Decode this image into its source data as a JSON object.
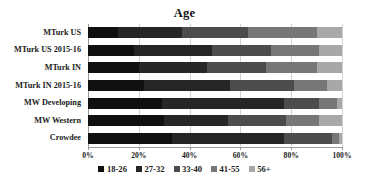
{
  "chart_data": {
    "type": "bar",
    "orientation": "horizontal",
    "stacked": true,
    "normalized_percent": true,
    "title": "Age",
    "xlabel": "",
    "ylabel": "",
    "xlim": [
      0,
      100
    ],
    "xticks": [
      0,
      20,
      40,
      60,
      80,
      100
    ],
    "xtick_labels": [
      "0%",
      "20%",
      "40%",
      "60%",
      "80%",
      "100%"
    ],
    "grid": "vertical",
    "legend_position": "bottom",
    "categories": [
      "MTurk US",
      "MTurk US  2015-16",
      "MTurk IN",
      "MTurk IN 2015-16",
      "MW Developing",
      "MW Western",
      "Crowdee"
    ],
    "series": [
      {
        "name": "18-26",
        "color": "#101010",
        "values": [
          12,
          18,
          20,
          22,
          29,
          30,
          33
        ]
      },
      {
        "name": "27-32",
        "color": "#262626",
        "values": [
          25,
          31,
          27,
          34,
          48,
          25,
          44
        ]
      },
      {
        "name": "33-40",
        "color": "#4c4c4c",
        "values": [
          26,
          23,
          23,
          25,
          14,
          23,
          19
        ]
      },
      {
        "name": "41-55",
        "color": "#777777",
        "values": [
          27,
          19,
          20,
          13,
          7,
          13,
          3
        ]
      },
      {
        "name": "56+",
        "color": "#a8a8a8",
        "values": [
          10,
          9,
          10,
          6,
          2,
          9,
          1
        ]
      }
    ]
  }
}
